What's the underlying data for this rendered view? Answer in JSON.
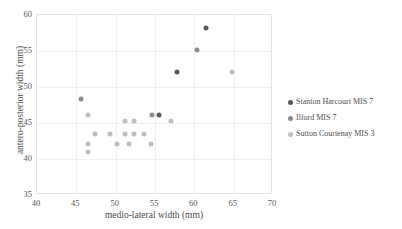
{
  "chart_data": {
    "type": "scatter",
    "title": "",
    "xlabel": "medio-lateral width (mm)",
    "ylabel": "antero-posterior width (mm)",
    "xlim": [
      40,
      70
    ],
    "ylim": [
      35,
      60
    ],
    "xticks": [
      40,
      45,
      50,
      55,
      60,
      65,
      70
    ],
    "yticks": [
      35,
      40,
      45,
      50,
      55,
      60
    ],
    "grid": true,
    "legend_position": "right",
    "series": [
      {
        "name": "Stanton Harcourt MIS 7",
        "color": "#595959",
        "points": [
          [
            61.6,
            58.0
          ],
          [
            57.9,
            52.0
          ],
          [
            55.6,
            46.0
          ]
        ]
      },
      {
        "name": "Ilford MIS 7",
        "color": "#8c8c8c",
        "points": [
          [
            60.5,
            55.0
          ],
          [
            54.8,
            46.0
          ],
          [
            45.7,
            48.2
          ]
        ]
      },
      {
        "name": "Sutton Courtenay MIS 3",
        "color": "#bfbfbf",
        "points": [
          [
            64.9,
            52.0
          ],
          [
            57.2,
            45.2
          ],
          [
            52.5,
            45.2
          ],
          [
            51.3,
            45.2
          ],
          [
            53.7,
            43.3
          ],
          [
            52.5,
            43.3
          ],
          [
            51.3,
            43.3
          ],
          [
            54.6,
            42.0
          ],
          [
            49.4,
            43.3
          ],
          [
            47.5,
            43.3
          ],
          [
            46.6,
            46.0
          ],
          [
            46.6,
            42.0
          ],
          [
            46.6,
            40.8
          ],
          [
            50.3,
            42.0
          ],
          [
            51.8,
            42.0
          ]
        ]
      }
    ]
  },
  "axes": {
    "x_title": "medio-lateral width (mm)",
    "y_title": "antero-posterior width (mm)",
    "x_tick_labels": [
      "40",
      "45",
      "50",
      "55",
      "60",
      "65",
      "70"
    ],
    "y_tick_labels": [
      "35",
      "40",
      "45",
      "50",
      "55",
      "60"
    ]
  },
  "legend": {
    "items": [
      {
        "label": "Stanton Harcourt MIS 7",
        "color": "#595959"
      },
      {
        "label": "Ilford MIS 7",
        "color": "#8c8c8c"
      },
      {
        "label": "Sutton Courtenay MIS 3",
        "color": "#bfbfbf"
      }
    ]
  }
}
